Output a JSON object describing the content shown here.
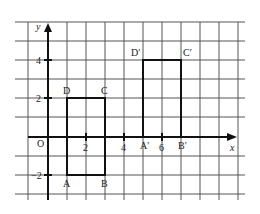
{
  "diagram": {
    "type": "coordinate-grid-translation",
    "axes": {
      "x_label": "x",
      "y_label": "y",
      "origin_label": "O",
      "x_ticks": [
        "2",
        "4",
        "6"
      ],
      "y_ticks": [
        "4",
        "2",
        "−2"
      ]
    },
    "shape_original": {
      "name": "ABCD",
      "vertices": [
        {
          "label": "A",
          "x": 1,
          "y": -2
        },
        {
          "label": "B",
          "x": 3,
          "y": -2
        },
        {
          "label": "C",
          "x": 3,
          "y": 2
        },
        {
          "label": "D",
          "x": 1,
          "y": 2
        }
      ]
    },
    "shape_image": {
      "name": "A'B'C'D'",
      "vertices": [
        {
          "label": "A′",
          "x": 5,
          "y": 0
        },
        {
          "label": "B′",
          "x": 7,
          "y": 0
        },
        {
          "label": "C′",
          "x": 7,
          "y": 4
        },
        {
          "label": "D′",
          "x": 5,
          "y": 4
        }
      ]
    }
  }
}
